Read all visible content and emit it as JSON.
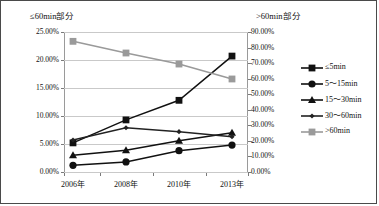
{
  "chart_data": {
    "type": "line",
    "title": "",
    "categories": [
      "2006年",
      "2008年",
      "2010年",
      "2013年"
    ],
    "xlabel": "",
    "left_axis": {
      "label": "≤60min部分",
      "ticks": [
        "0.00%",
        "5.00%",
        "10.00%",
        "15.00%",
        "20.00%",
        "25.00%"
      ],
      "ylim": [
        0,
        25
      ],
      "ylabel": "≤60min部分"
    },
    "right_axis": {
      "label": ">60min部分",
      "ticks": [
        "0.00%",
        "10.00%",
        "20.00%",
        "30.00%",
        "40.00%",
        "50.00%",
        "60.00%",
        "70.00%",
        "80.00%",
        "90.00%"
      ],
      "ylim": [
        0,
        90
      ],
      "ylabel": ">60min部分"
    },
    "grid": true,
    "legend_position": "right",
    "series": [
      {
        "name": "≤5min",
        "axis": "left",
        "marker": "square",
        "color": "#111111",
        "values": [
          5.2,
          9.3,
          12.8,
          20.7
        ]
      },
      {
        "name": "5～15min",
        "axis": "left",
        "marker": "circle",
        "color": "#111111",
        "values": [
          1.2,
          1.8,
          3.8,
          4.8
        ]
      },
      {
        "name": "15～30min",
        "axis": "left",
        "marker": "triangle",
        "color": "#111111",
        "values": [
          3.0,
          3.9,
          5.6,
          7.0
        ]
      },
      {
        "name": "30～60min",
        "axis": "left",
        "marker": "small-diamond",
        "color": "#222222",
        "values": [
          5.7,
          7.9,
          7.2,
          6.3
        ]
      },
      {
        "name": ">60min",
        "axis": "right",
        "marker": "square",
        "color": "#9a9a9a",
        "values": [
          84.0,
          76.5,
          69.4,
          59.8
        ]
      }
    ]
  },
  "legend": {
    "items": [
      {
        "label": "≤5min"
      },
      {
        "label": "5～15min"
      },
      {
        "label": "15～30min"
      },
      {
        "label": "30～60min"
      },
      {
        "label": ">60min"
      }
    ]
  }
}
